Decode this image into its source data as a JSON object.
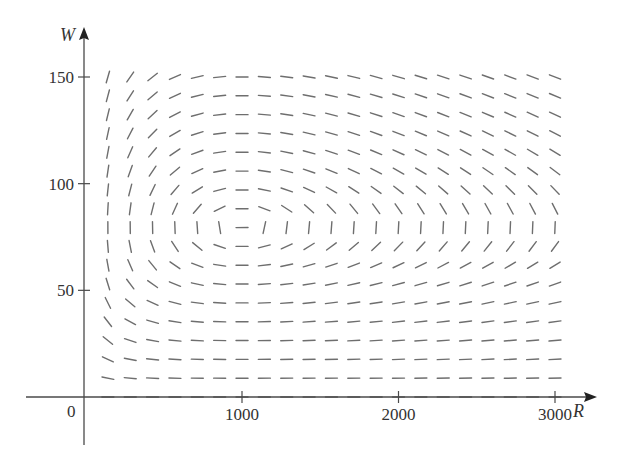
{
  "chart_data": {
    "type": "direction_field",
    "title": "",
    "xlabel": "R",
    "ylabel": "W",
    "xlim": [
      0,
      3000
    ],
    "ylim": [
      0,
      150
    ],
    "x_ticks": [
      1000,
      2000,
      3000
    ],
    "x_tick_labels": [
      "1000",
      "2000",
      "3000"
    ],
    "y_ticks": [
      50,
      100,
      150
    ],
    "y_tick_labels": [
      "50",
      "100",
      "150"
    ],
    "origin_label": "0",
    "grid": false,
    "model": {
      "dR_dt": "0.08*R - 0.001*R*W",
      "dW_dt": "-0.02*W + 0.00002*R*W",
      "params": {
        "k": 0.08,
        "a": 0.001,
        "r": 0.02,
        "b": 2e-05
      }
    },
    "equilibrium": {
      "R": 1000,
      "W": 80
    },
    "field_grid": {
      "R_count": 21,
      "R_min": 143,
      "R_max": 3000,
      "W_count": 18,
      "W_min": 0,
      "W_max": 150
    },
    "segment_length_px": 12,
    "colors": {
      "segments": "#6e6e6e",
      "axes": "#4a4a4a",
      "text": "#333333"
    }
  }
}
